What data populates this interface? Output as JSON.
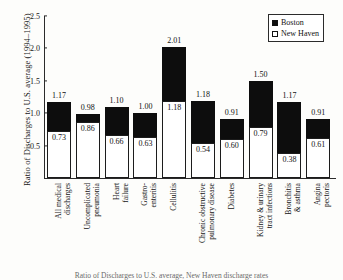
{
  "chart_data": {
    "type": "bar",
    "title": "",
    "xlabel": "",
    "ylabel": "Ratio of Discharges to U.S. average (1994–1995)",
    "ylim": [
      0,
      2.5
    ],
    "ytick_values": [
      2.5,
      2.0,
      1.5,
      1.0,
      0.5
    ],
    "ytick_labels": [
      "2.5",
      "2.0",
      "1.5",
      "1.0",
      "0.5"
    ],
    "grid": false,
    "legend_position": "top-right",
    "categories": [
      "All medical discharges",
      "Uncomplicated pneumonia",
      "Heart failure",
      "Gastro-enteritis",
      "Cellulitis",
      "Chronic obstructive pulmonary disease",
      "Diabetes",
      "Kidney & urinary tract infections",
      "Bronchitis & asthma",
      "Angina pectoris"
    ],
    "category_label_lines": [
      [
        "All medical",
        "discharges"
      ],
      [
        "Uncomplicated",
        "pneumonia"
      ],
      [
        "Heart",
        "failure"
      ],
      [
        "Gastro-",
        "enteritis"
      ],
      [
        "Cellulitis"
      ],
      [
        "Chronic obstructive",
        "pulmonary disease"
      ],
      [
        "Diabetes"
      ],
      [
        "Kidney & urinary",
        "tract infections"
      ],
      [
        "Bronchitis",
        "& asthma"
      ],
      [
        "Angina",
        "pectoris"
      ]
    ],
    "series": [
      {
        "name": "Boston",
        "color": "#0d0d0d",
        "values": [
          1.17,
          0.98,
          1.1,
          1.0,
          2.01,
          1.18,
          0.91,
          1.5,
          1.17,
          0.91
        ],
        "labels": [
          "1.17",
          "0.98",
          "1.10",
          "1.00",
          "2.01",
          "1.18",
          "0.91",
          "1.50",
          "1.17",
          "0.91"
        ]
      },
      {
        "name": "New Haven",
        "color": "#ffffff",
        "values": [
          0.73,
          0.86,
          0.66,
          0.63,
          1.18,
          0.54,
          0.6,
          0.79,
          0.38,
          0.61
        ],
        "labels": [
          "0.73",
          "0.86",
          "0.66",
          "0.63",
          "1.18",
          "0.54",
          "0.60",
          "0.79",
          "0.38",
          "0.61"
        ]
      }
    ]
  },
  "legend": {
    "entries": [
      {
        "label": "Boston",
        "swatch": "filled-square"
      },
      {
        "label": "New Haven",
        "swatch": "open-square"
      }
    ]
  },
  "caption": {
    "text": "Ratio of Discharges to U.S. average, New Haven discharge rates"
  }
}
